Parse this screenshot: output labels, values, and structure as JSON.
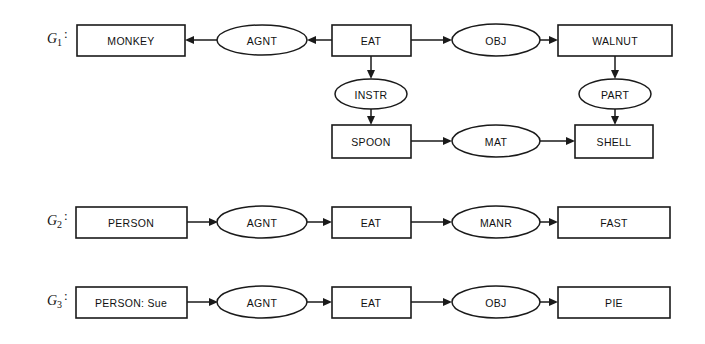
{
  "figure": {
    "background_color": "#ffffff",
    "line_color": "#1a1a1a",
    "text_color": "#111111",
    "width": 705,
    "height": 344
  },
  "graphs": [
    {
      "id": "G1",
      "label_base": "G",
      "label_sub": "1",
      "label_colon": ":",
      "concepts": [
        {
          "key": "monkey",
          "text": "MONKEY",
          "shape": "box"
        },
        {
          "key": "eat1",
          "text": "EAT",
          "shape": "box"
        },
        {
          "key": "walnut",
          "text": "WALNUT",
          "shape": "box"
        },
        {
          "key": "spoon",
          "text": "SPOON",
          "shape": "box"
        },
        {
          "key": "shell",
          "text": "SHELL",
          "shape": "box"
        }
      ],
      "relations": [
        {
          "key": "agnt1",
          "text": "AGNT",
          "shape": "ellipse"
        },
        {
          "key": "obj1",
          "text": "OBJ",
          "shape": "ellipse"
        },
        {
          "key": "instr1",
          "text": "INSTR",
          "shape": "ellipse"
        },
        {
          "key": "part1",
          "text": "PART",
          "shape": "ellipse"
        },
        {
          "key": "mat1",
          "text": "MAT",
          "shape": "ellipse"
        }
      ],
      "edges": [
        {
          "from": "eat1",
          "to": "agnt1",
          "direction": "left"
        },
        {
          "from": "agnt1",
          "to": "monkey",
          "direction": "left"
        },
        {
          "from": "eat1",
          "to": "obj1",
          "direction": "right"
        },
        {
          "from": "obj1",
          "to": "walnut",
          "direction": "right"
        },
        {
          "from": "eat1",
          "to": "instr1",
          "direction": "down"
        },
        {
          "from": "instr1",
          "to": "spoon",
          "direction": "down"
        },
        {
          "from": "walnut",
          "to": "part1",
          "direction": "down"
        },
        {
          "from": "part1",
          "to": "shell",
          "direction": "down"
        },
        {
          "from": "spoon",
          "to": "mat1",
          "direction": "right"
        },
        {
          "from": "mat1",
          "to": "shell",
          "direction": "right"
        }
      ]
    },
    {
      "id": "G2",
      "label_base": "G",
      "label_sub": "2",
      "label_colon": ":",
      "concepts": [
        {
          "key": "person2",
          "text": "PERSON",
          "shape": "box"
        },
        {
          "key": "eat2",
          "text": "EAT",
          "shape": "box"
        },
        {
          "key": "fast2",
          "text": "FAST",
          "shape": "box"
        }
      ],
      "relations": [
        {
          "key": "agnt2",
          "text": "AGNT",
          "shape": "ellipse"
        },
        {
          "key": "manr2",
          "text": "MANR",
          "shape": "ellipse"
        }
      ],
      "edges": [
        {
          "from": "person2",
          "to": "agnt2",
          "direction": "right"
        },
        {
          "from": "agnt2",
          "to": "eat2",
          "direction": "right"
        },
        {
          "from": "eat2",
          "to": "manr2",
          "direction": "right"
        },
        {
          "from": "manr2",
          "to": "fast2",
          "direction": "right"
        }
      ]
    },
    {
      "id": "G3",
      "label_base": "G",
      "label_sub": "3",
      "label_colon": ":",
      "concepts": [
        {
          "key": "person3",
          "text": "PERSON: Sue",
          "shape": "box"
        },
        {
          "key": "eat3",
          "text": "EAT",
          "shape": "box"
        },
        {
          "key": "pie3",
          "text": "PIE",
          "shape": "box"
        }
      ],
      "relations": [
        {
          "key": "agnt3",
          "text": "AGNT",
          "shape": "ellipse"
        },
        {
          "key": "obj3",
          "text": "OBJ",
          "shape": "ellipse"
        }
      ],
      "edges": [
        {
          "from": "person3",
          "to": "agnt3",
          "direction": "right"
        },
        {
          "from": "agnt3",
          "to": "eat3",
          "direction": "right"
        },
        {
          "from": "eat3",
          "to": "obj3",
          "direction": "right"
        },
        {
          "from": "obj3",
          "to": "pie3",
          "direction": "right"
        }
      ]
    }
  ],
  "node_text": {
    "g1_monkey": "MONKEY",
    "g1_agnt": "AGNT",
    "g1_eat": "EAT",
    "g1_obj": "OBJ",
    "g1_walnut": "WALNUT",
    "g1_instr": "INSTR",
    "g1_part": "PART",
    "g1_spoon": "SPOON",
    "g1_mat": "MAT",
    "g1_shell": "SHELL",
    "g2_person": "PERSON",
    "g2_agnt": "AGNT",
    "g2_eat": "EAT",
    "g2_manr": "MANR",
    "g2_fast": "FAST",
    "g3_person": "PERSON: Sue",
    "g3_agnt": "AGNT",
    "g3_eat": "EAT",
    "g3_obj": "OBJ",
    "g3_pie": "PIE"
  },
  "labels": {
    "g1_base": "G",
    "g1_sub": "1",
    "g2_base": "G",
    "g2_sub": "2",
    "g3_base": "G",
    "g3_sub": "3",
    "colon": ":"
  }
}
